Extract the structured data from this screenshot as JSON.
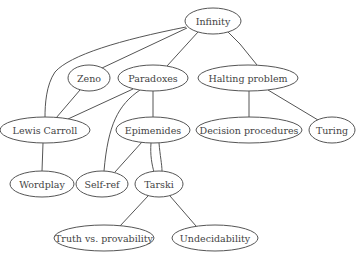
{
  "diagram": {
    "type": "concept-graph",
    "colors": {
      "stroke": "#555555",
      "text": "#444444",
      "background": "#ffffff",
      "node_fill": "#ffffff"
    },
    "nodes": [
      {
        "id": "infinity",
        "label": "Infinity",
        "cx": 213,
        "cy": 21,
        "rx": 28,
        "ry": 13
      },
      {
        "id": "zeno",
        "label": "Zeno",
        "cx": 89,
        "cy": 78,
        "rx": 21,
        "ry": 13
      },
      {
        "id": "paradoxes",
        "label": "Paradoxes",
        "cx": 153,
        "cy": 78,
        "rx": 35,
        "ry": 13
      },
      {
        "id": "halting",
        "label": "Halting problem",
        "cx": 248,
        "cy": 78,
        "rx": 50,
        "ry": 13
      },
      {
        "id": "carroll",
        "label": "Lewis Carroll",
        "cx": 45,
        "cy": 130,
        "rx": 45,
        "ry": 13
      },
      {
        "id": "epimenides",
        "label": "Epimenides",
        "cx": 153,
        "cy": 130,
        "rx": 37,
        "ry": 13
      },
      {
        "id": "decision",
        "label": "Decision procedures",
        "cx": 249,
        "cy": 130,
        "rx": 53,
        "ry": 13
      },
      {
        "id": "turing",
        "label": "Turing",
        "cx": 332,
        "cy": 130,
        "rx": 23,
        "ry": 13
      },
      {
        "id": "wordplay",
        "label": "Wordplay",
        "cx": 42,
        "cy": 184,
        "rx": 32,
        "ry": 13
      },
      {
        "id": "selfref",
        "label": "Self-ref",
        "cx": 102,
        "cy": 184,
        "rx": 26,
        "ry": 13
      },
      {
        "id": "tarski",
        "label": "Tarski",
        "cx": 159,
        "cy": 184,
        "rx": 24,
        "ry": 13
      },
      {
        "id": "truth",
        "label": "Truth vs. provability",
        "cx": 104,
        "cy": 238,
        "rx": 50,
        "ry": 13
      },
      {
        "id": "undecidability",
        "label": "Undecidability",
        "cx": 215,
        "cy": 238,
        "rx": 43,
        "ry": 13
      }
    ],
    "edges": [
      {
        "from": "infinity",
        "to": "carroll",
        "path": "M186,27 C120,40 70,55 55,72 C46,85 45,105 45,117"
      },
      {
        "from": "infinity",
        "to": "zeno",
        "path": "M187,28 L102,68"
      },
      {
        "from": "infinity",
        "to": "paradoxes",
        "path": "M198,32 L167,66"
      },
      {
        "from": "infinity",
        "to": "halting",
        "path": "M228,32 L239,43 L240,44 L257,65"
      },
      {
        "from": "zeno",
        "to": "carroll",
        "path": "M80,90 L56,118"
      },
      {
        "from": "paradoxes",
        "to": "carroll",
        "path": "M133,89 L68,119"
      },
      {
        "from": "paradoxes",
        "to": "selfref",
        "path": "M140,90 C118,105 108,125 104,171"
      },
      {
        "from": "paradoxes",
        "to": "epimenides",
        "path": "M153,91 L153,117"
      },
      {
        "from": "halting",
        "to": "decision",
        "path": "M249,91 L249,117"
      },
      {
        "from": "halting",
        "to": "turing",
        "path": "M268,90 L318,120"
      },
      {
        "from": "carroll",
        "to": "wordplay",
        "path": "M43,143 L42,171"
      },
      {
        "from": "epimenides",
        "to": "selfref",
        "path": "M142,142 L115,172"
      },
      {
        "from": "epimenides",
        "to": "tarski",
        "path": "M151,143 C150,155 152,165 154,172"
      },
      {
        "from": "epimenides",
        "to": "tarski",
        "path": "M159,143 C160,155 162,165 162,171"
      },
      {
        "from": "tarski",
        "to": "truth",
        "path": "M148,196 L120,226"
      },
      {
        "from": "tarski",
        "to": "undecidability",
        "path": "M170,196 L196,226"
      }
    ]
  }
}
